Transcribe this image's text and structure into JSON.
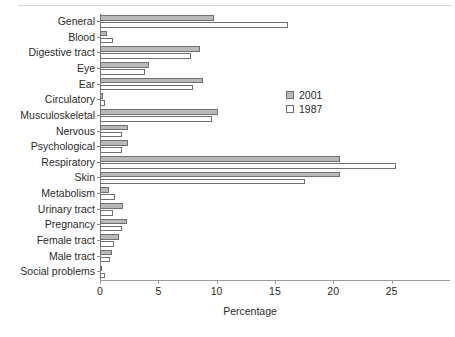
{
  "chart_data": {
    "type": "bar",
    "orientation": "horizontal",
    "title": "",
    "xlabel": "Percentage",
    "ylabel": "",
    "xlim": [
      0,
      29.5
    ],
    "xticks": [
      0,
      5,
      10,
      15,
      20,
      25
    ],
    "xtick_labels": [
      "0",
      "5",
      "10",
      "15",
      "20",
      "25"
    ],
    "grid": false,
    "legend_position": "upper right inside",
    "categories": [
      "General",
      "Blood",
      "Digestive tract",
      "Eye",
      "Ear",
      "Circulatory",
      "Musculoskeletal",
      "Nervous",
      "Psychological",
      "Respiratory",
      "Skin",
      "Metabolism",
      "Urinary tract",
      "Pregnancy",
      "Female tract",
      "Male tract",
      "Social problems"
    ],
    "series": [
      {
        "name": "2001",
        "color": "#b9b9b9",
        "values": [
          9.8,
          0.6,
          8.6,
          4.2,
          8.8,
          0.3,
          10.1,
          2.4,
          2.4,
          20.6,
          20.6,
          0.8,
          2.0,
          2.3,
          1.6,
          1.0,
          0.2
        ]
      },
      {
        "name": "1987",
        "color": "#ffffff",
        "values": [
          16.1,
          1.1,
          7.8,
          3.9,
          8.0,
          0.4,
          9.6,
          1.9,
          1.9,
          25.4,
          17.6,
          1.3,
          1.1,
          1.9,
          1.2,
          0.9,
          0.4
        ]
      }
    ]
  },
  "legend": {
    "entries": [
      {
        "label": "2001",
        "swatch": "filled-gray-swatch"
      },
      {
        "label": "1987",
        "swatch": "empty-white-swatch"
      }
    ]
  },
  "axis": {
    "x_title": "Percentage"
  }
}
